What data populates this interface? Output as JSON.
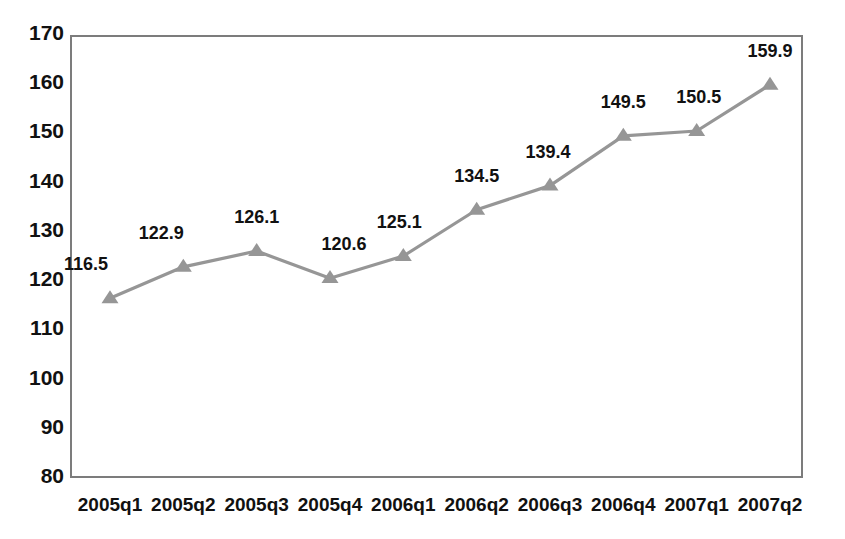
{
  "chart_data": {
    "type": "line",
    "title": "",
    "subtitle": "",
    "xlabel": "",
    "ylabel": "",
    "categories": [
      "2005q1",
      "2005q2",
      "2005q3",
      "2005q4",
      "2006q1",
      "2006q2",
      "2006q3",
      "2006q4",
      "2007q1",
      "2007q2"
    ],
    "values": [
      116.5,
      122.9,
      126.1,
      120.6,
      125.1,
      134.5,
      139.4,
      149.5,
      150.5,
      159.9
    ],
    "series": [
      {
        "name": "",
        "values": [
          116.5,
          122.9,
          126.1,
          120.6,
          125.1,
          134.5,
          139.4,
          149.5,
          150.5,
          159.9
        ]
      }
    ],
    "point_labels": [
      "116.5",
      "122.9",
      "126.1",
      "120.6",
      "125.1",
      "134.5",
      "139.4",
      "149.5",
      "150.5",
      "159.9"
    ],
    "ylim": [
      80,
      170
    ],
    "ytick_step": 10,
    "ytick_labels": [
      "170",
      "160",
      "150",
      "140",
      "130",
      "120",
      "110",
      "100",
      "90",
      "80"
    ],
    "xtick_labels": [
      "2005q1",
      "2005q2",
      "2005q3",
      "2005q4",
      "2006q1",
      "2006q2",
      "2006q3",
      "2006q4",
      "2007q1",
      "2007q2"
    ],
    "grid": false,
    "legend": false,
    "legend_position": "none",
    "marker": "triangle",
    "colors": {
      "line": "#969696",
      "marker": "#969696",
      "axis": "#7c7c7c",
      "text": "#111111",
      "background": "#ffffff"
    }
  }
}
